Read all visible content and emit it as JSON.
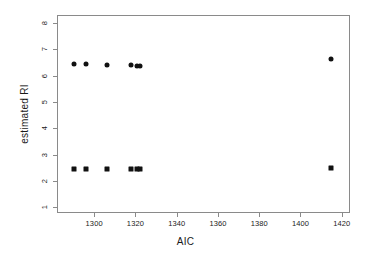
{
  "chart_data": {
    "type": "scatter",
    "title": "",
    "xlabel": "AIC",
    "ylabel": "estimated RI",
    "xlim": [
      1282,
      1424
    ],
    "ylim": [
      0.78,
      8.3
    ],
    "grid": false,
    "legend": null,
    "x_ticks": [
      1300,
      1320,
      1340,
      1360,
      1380,
      1400,
      1420
    ],
    "x_tick_labels": [
      "1300",
      "1320",
      "1340",
      "1360",
      "1380",
      "1400",
      "1420"
    ],
    "y_ticks": [
      1,
      2,
      3,
      4,
      5,
      6,
      7,
      8
    ],
    "y_tick_labels": [
      "1",
      "2",
      "3",
      "4",
      "5",
      "6",
      "7",
      "8"
    ],
    "series": [
      {
        "name": "upper",
        "marker": "circle",
        "color": "#111111",
        "points": [
          {
            "x": 1290,
            "y": 6.44
          },
          {
            "x": 1296,
            "y": 6.43
          },
          {
            "x": 1306,
            "y": 6.41
          },
          {
            "x": 1318,
            "y": 6.42
          },
          {
            "x": 1321,
            "y": 6.38
          },
          {
            "x": 1322,
            "y": 6.38
          },
          {
            "x": 1415,
            "y": 6.62
          }
        ]
      },
      {
        "name": "lower",
        "marker": "square",
        "color": "#111111",
        "points": [
          {
            "x": 1290,
            "y": 2.46
          },
          {
            "x": 1296,
            "y": 2.46
          },
          {
            "x": 1306,
            "y": 2.45
          },
          {
            "x": 1318,
            "y": 2.45
          },
          {
            "x": 1321,
            "y": 2.44
          },
          {
            "x": 1322,
            "y": 2.44
          },
          {
            "x": 1415,
            "y": 2.5
          }
        ]
      }
    ]
  },
  "axes": {
    "x_title": "AIC",
    "y_title": "estimated RI"
  },
  "colors": {
    "marker": "#111111",
    "axis": "#8a8a8a",
    "background": "#ffffff",
    "text": "#1a1a1a"
  }
}
